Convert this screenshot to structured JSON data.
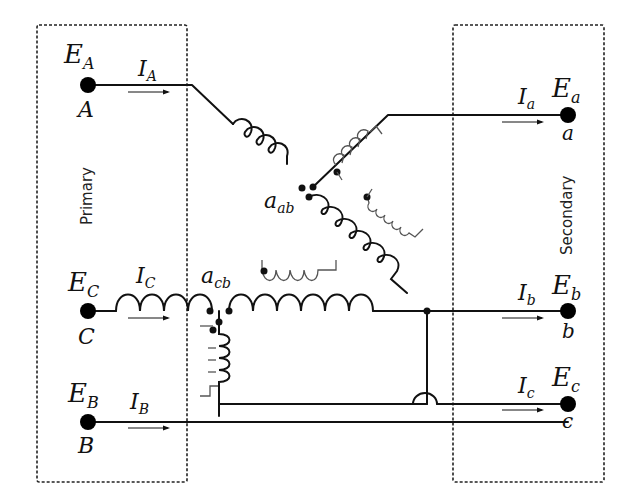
{
  "diagram": {
    "type": "three-phase autotransformer / phase-shifting transformer connection",
    "boxes": {
      "primary": {
        "label": "Primary"
      },
      "secondary": {
        "label": "Secondary"
      }
    },
    "primary_terminals": [
      {
        "node": "A",
        "voltage": "E",
        "voltage_sub": "A",
        "current": "I",
        "current_sub": "A"
      },
      {
        "node": "C",
        "voltage": "E",
        "voltage_sub": "C",
        "current": "I",
        "current_sub": "C"
      },
      {
        "node": "B",
        "voltage": "E",
        "voltage_sub": "B",
        "current": "I",
        "current_sub": "B"
      }
    ],
    "secondary_terminals": [
      {
        "node": "a",
        "voltage": "E",
        "voltage_sub": "a",
        "current": "I",
        "current_sub": "a"
      },
      {
        "node": "b",
        "voltage": "E",
        "voltage_sub": "b",
        "current": "I",
        "current_sub": "b"
      },
      {
        "node": "c",
        "voltage": "E",
        "voltage_sub": "c",
        "current": "I",
        "current_sub": "c"
      }
    ],
    "windings": [
      {
        "label": "a",
        "label_sub": "ab"
      },
      {
        "label": "a",
        "label_sub": "cb"
      }
    ]
  }
}
